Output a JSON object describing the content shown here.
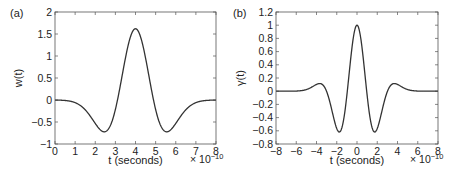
{
  "chart_data": [
    {
      "type": "line",
      "panel_label": "(a)",
      "title": "",
      "xlabel": "t (seconds)",
      "ylabel": "w(t)",
      "x_multiplier": "× 10−10",
      "x_multiplier_base": "× 10",
      "x_multiplier_exp": "−10",
      "xlim": [
        0,
        8
      ],
      "ylim": [
        -1,
        2
      ],
      "xticks": [
        0,
        1,
        2,
        3,
        4,
        5,
        6,
        7,
        8
      ],
      "yticks": [
        -1,
        -0.5,
        0,
        0.5,
        1,
        1.5,
        2
      ],
      "ytick_labels": [
        "−1",
        "−0.5",
        "0",
        "0.5",
        "1",
        "1.5",
        "2"
      ],
      "xtick_labels": [
        "0",
        "1",
        "2",
        "3",
        "4",
        "5",
        "6",
        "7",
        "8"
      ],
      "grid": false,
      "series": [
        {
          "name": "w(t)",
          "shape": "mexican-hat (negative 2nd derivative of Gaussian)",
          "center": 4,
          "peak": 1.62,
          "sigma": 0.895,
          "key_points": [
            {
              "x": 0,
              "y": 0.0
            },
            {
              "x": 1,
              "y": -0.03
            },
            {
              "x": 2,
              "y": -0.6
            },
            {
              "x": 2.45,
              "y": -0.72
            },
            {
              "x": 3,
              "y": -0.2
            },
            {
              "x": 3.5,
              "y": 1.0
            },
            {
              "x": 4,
              "y": 1.62
            },
            {
              "x": 4.5,
              "y": 1.0
            },
            {
              "x": 5,
              "y": -0.2
            },
            {
              "x": 5.55,
              "y": -0.72
            },
            {
              "x": 6,
              "y": -0.6
            },
            {
              "x": 7,
              "y": -0.03
            },
            {
              "x": 8,
              "y": 0.0
            }
          ]
        }
      ]
    },
    {
      "type": "line",
      "panel_label": "(b)",
      "title": "",
      "xlabel": "t (seconds)",
      "ylabel": "γ(t)",
      "x_multiplier": "× 10−10",
      "x_multiplier_base": "× 10",
      "x_multiplier_exp": "−10",
      "xlim": [
        -8,
        8
      ],
      "ylim": [
        -0.8,
        1.2
      ],
      "xticks": [
        -8,
        -6,
        -4,
        -2,
        0,
        2,
        4,
        6,
        8
      ],
      "xtick_labels": [
        "−8",
        "−6",
        "−4",
        "−2",
        "0",
        "2",
        "4",
        "6",
        "8"
      ],
      "yticks": [
        -0.8,
        -0.6,
        -0.4,
        -0.2,
        0,
        0.2,
        0.4,
        0.6,
        0.8,
        1,
        1.2
      ],
      "ytick_labels": [
        "−0.8",
        "−0.6",
        "−0.4",
        "−0.2",
        "0",
        "0.2",
        "0.4",
        "0.6",
        "0.8",
        "1",
        "1.2"
      ],
      "grid": false,
      "series": [
        {
          "name": "γ(t)",
          "shape": "normalized 4th derivative of Gaussian (autocorrelation)",
          "center": 0,
          "peak": 1.0,
          "sigma": 1.29,
          "key_points": [
            {
              "x": -8,
              "y": 0.0
            },
            {
              "x": -5,
              "y": 0.03
            },
            {
              "x": -3.7,
              "y": 0.11
            },
            {
              "x": -3,
              "y": 0.02
            },
            {
              "x": -1.75,
              "y": -0.62
            },
            {
              "x": -1,
              "y": -0.1
            },
            {
              "x": 0,
              "y": 1.0
            },
            {
              "x": 1,
              "y": -0.1
            },
            {
              "x": 1.75,
              "y": -0.62
            },
            {
              "x": 3,
              "y": 0.02
            },
            {
              "x": 3.7,
              "y": 0.11
            },
            {
              "x": 5,
              "y": 0.03
            },
            {
              "x": 8,
              "y": 0.0
            }
          ]
        }
      ]
    }
  ]
}
